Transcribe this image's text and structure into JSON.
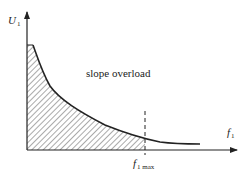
{
  "diagram": {
    "type": "slope-overload-curve",
    "y_axis": {
      "symbol": "U",
      "subscript": "1"
    },
    "x_axis": {
      "symbol": "f",
      "subscript": "1"
    },
    "region_label": "slope overload",
    "marker": {
      "symbol": "f",
      "subscript": "1 max"
    },
    "colors": {
      "line": "#222222",
      "hatch": "#555555",
      "background": "#ffffff"
    }
  }
}
